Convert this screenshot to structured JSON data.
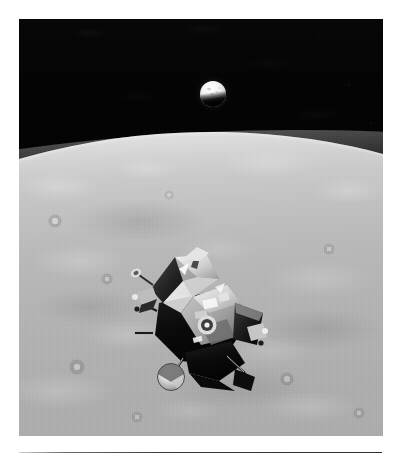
{
  "page": {
    "background_color": "#ffffff",
    "width": 402,
    "height": 459
  },
  "photograph": {
    "name": "apollo-lunar-module-ascent-stage-photo",
    "type": "black-and-white photograph",
    "alt_text": "Apollo Lunar Module ascent stage in lunar orbit with the Moon's cratered surface below and a gibbous Earth rising above the horizon",
    "frame": {
      "x": 19,
      "y": 19,
      "width": 364,
      "height": 417
    },
    "border_color": "#ffffff"
  },
  "scene": {
    "sky": {
      "label": "deep space",
      "color": "#040404"
    },
    "earth": {
      "label": "Earth",
      "phase": "gibbous",
      "lit_from": "top",
      "color_lit": "#f6f6f6",
      "color_shadow": "#050505",
      "position": {
        "x": 181,
        "y": 62,
        "size": 26
      }
    },
    "horizon": {
      "label": "lunar horizon",
      "curve": "convex limb, tilted slightly down to the right",
      "y_left": 118,
      "y_right": 138
    },
    "surface": {
      "label": "lunar surface",
      "description": "mottled grey mare and highland terrain with scattered craters",
      "color_light": "#cfcfcf",
      "color_mid": "#ababab",
      "color_dark": "#9c9c9c"
    },
    "spacecraft": {
      "label": "Lunar Module ascent stage",
      "orientation": "tilted, ascent engine toward lower left",
      "parts": [
        "ascent stage crew cabin",
        "docking target",
        "forward hatch",
        "rendezvous radar antenna",
        "S-band steerable antenna",
        "reaction control system thruster quad",
        "ascent engine cover",
        "gold and black thermal blanket"
      ],
      "color_bright": "#e6e6e6",
      "color_shadow": "#0c0c0c",
      "position": {
        "x": 104,
        "y": 222,
        "width": 150,
        "height": 155
      }
    }
  },
  "rule": {
    "label": "horizontal rule",
    "color": "#2e2e2e",
    "position": {
      "x": 19,
      "y": 452,
      "width": 363,
      "height": 1
    }
  }
}
